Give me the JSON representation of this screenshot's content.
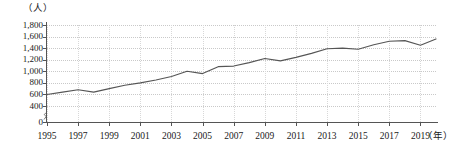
{
  "chart_data": {
    "type": "line",
    "title": "",
    "subtitle": "",
    "xlabel": "年",
    "ylabel": "人",
    "y_unit_label": "（人）",
    "x_unit_label": "（年）",
    "grid": true,
    "legend": "none",
    "xlim": [
      1995,
      2020
    ],
    "ylim": [
      0,
      1800
    ],
    "y_axis_break": true,
    "y_axis_break_note": "axis broken between 0 and 400",
    "yticks": [
      0,
      400,
      600,
      800,
      1000,
      1200,
      1400,
      1600,
      1800
    ],
    "ytick_labels": [
      "0",
      "400",
      "600",
      "800",
      "1,000",
      "1,200",
      "1,400",
      "1,600",
      "1,800"
    ],
    "xticks": [
      1995,
      1997,
      1999,
      2001,
      2003,
      2005,
      2007,
      2009,
      2011,
      2013,
      2015,
      2017,
      2019
    ],
    "xtick_labels": [
      "1995",
      "1997",
      "1999",
      "2001",
      "2003",
      "2005",
      "2007",
      "2009",
      "2011",
      "2013",
      "2015",
      "2017",
      "2019"
    ],
    "line_color": "#555555",
    "x": [
      1995,
      1996,
      1997,
      1998,
      1999,
      2000,
      2001,
      2002,
      2003,
      2004,
      2005,
      2006,
      2007,
      2008,
      2009,
      2010,
      2011,
      2012,
      2013,
      2014,
      2015,
      2016,
      2017,
      2018,
      2019,
      2020
    ],
    "values": [
      600,
      640,
      680,
      640,
      700,
      760,
      800,
      850,
      910,
      1000,
      960,
      1080,
      1090,
      1150,
      1220,
      1180,
      1240,
      1310,
      1390,
      1400,
      1380,
      1460,
      1520,
      1530,
      1450,
      1560
    ],
    "series": [
      {
        "name": "人数",
        "values": [
          600,
          640,
          680,
          640,
          700,
          760,
          800,
          850,
          910,
          1000,
          960,
          1080,
          1090,
          1150,
          1220,
          1180,
          1240,
          1310,
          1390,
          1400,
          1380,
          1460,
          1520,
          1530,
          1450,
          1560
        ]
      }
    ]
  }
}
